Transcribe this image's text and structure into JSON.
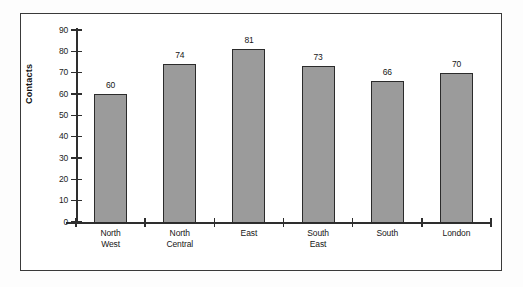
{
  "chart_data": {
    "type": "bar",
    "title": "",
    "xlabel": "",
    "ylabel": "Contacts",
    "categories": [
      "North West",
      "North Central",
      "East",
      "South East",
      "South",
      "London"
    ],
    "category_lines": [
      [
        "North",
        "West"
      ],
      [
        "North",
        "Central"
      ],
      [
        "East",
        ""
      ],
      [
        "South",
        "East"
      ],
      [
        "South",
        ""
      ],
      [
        "London",
        ""
      ]
    ],
    "values": [
      60,
      74,
      81,
      73,
      66,
      70
    ],
    "value_labels": [
      "60",
      "74",
      "81",
      "73",
      "66",
      "70"
    ],
    "ylim": [
      0,
      90
    ],
    "ytick_values": [
      0,
      10,
      20,
      30,
      40,
      50,
      60,
      70,
      80,
      90
    ],
    "ytick_labels": [
      "0",
      "10",
      "20",
      "30",
      "40",
      "50",
      "60",
      "70",
      "80",
      "90"
    ],
    "grid": false,
    "legend": false,
    "legend_position": "none",
    "bar_fill_color": "#9b9b9b",
    "bar_border_color": "#2b2b2b",
    "axis_color": "#2e2e2e",
    "frame_color": "#3a3a3a",
    "background_color": "#ffffff"
  }
}
